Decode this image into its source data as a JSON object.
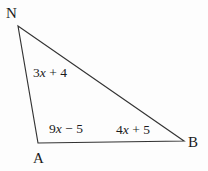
{
  "figure": {
    "type": "triangle-diagram",
    "background_color": "#fdfdfd",
    "stroke_color": "#333333",
    "text_color": "#1b1b1b",
    "vertices": [
      {
        "name": "N",
        "label": "N",
        "x": 18,
        "y": 26
      },
      {
        "name": "A",
        "label": "A",
        "x": 38,
        "y": 143
      },
      {
        "name": "B",
        "label": "B",
        "x": 184,
        "y": 141
      }
    ],
    "sides": [
      {
        "name": "side-NA",
        "from": "N",
        "to": "A",
        "label": "3x + 4",
        "coefficient": 3,
        "constant": 4,
        "operator": "+",
        "label_parts": {
          "coef": "3",
          "var": "x",
          "op": " + ",
          "const": "4"
        }
      },
      {
        "name": "side-AB-left-segment",
        "from": "A",
        "to": "B",
        "label": "9x − 5",
        "coefficient": 9,
        "constant": -5,
        "operator": "−",
        "label_parts": {
          "coef": "9",
          "var": "x",
          "op": " − ",
          "const": "5"
        }
      },
      {
        "name": "side-AB-right-segment",
        "from": "A",
        "to": "B",
        "label": "4x + 5",
        "coefficient": 4,
        "constant": 5,
        "operator": "+",
        "label_parts": {
          "coef": "4",
          "var": "x",
          "op": " + ",
          "const": "5"
        }
      }
    ]
  },
  "labels": {
    "vertex_N": "N",
    "vertex_A": "A",
    "vertex_B": "B",
    "side_NA": {
      "coef": "3",
      "var": "x",
      "op": " + ",
      "const": "4"
    },
    "side_A_mid": {
      "coef": "9",
      "var": "x",
      "op": " − ",
      "const": "5"
    },
    "side_mid_B": {
      "coef": "4",
      "var": "x",
      "op": " + ",
      "const": "5"
    }
  }
}
